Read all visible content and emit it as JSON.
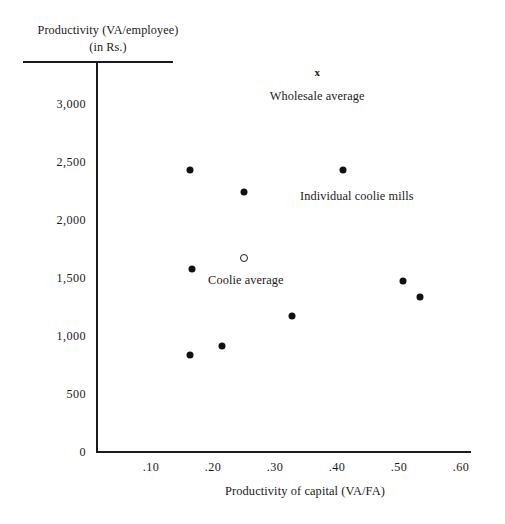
{
  "chart_data": {
    "type": "scatter",
    "title": "",
    "ylabel_line1": "Productivity (VA/employee)",
    "ylabel_line2": "(in Rs.)",
    "xlabel": "Productivity of capital (VA/FA)",
    "xlim": [
      0.0,
      0.65
    ],
    "ylim": [
      0,
      3400
    ],
    "grid": false,
    "legend": "none",
    "xticks": [
      ".10",
      ".20",
      ".30",
      ".40",
      ".50",
      ".60"
    ],
    "xtick_values": [
      0.1,
      0.2,
      0.3,
      0.4,
      0.5,
      0.6
    ],
    "yticks": [
      "0",
      "500",
      "1,000",
      "1,500",
      "2,000",
      "2,500",
      "3,000"
    ],
    "ytick_values": [
      0,
      500,
      1000,
      1500,
      2000,
      2500,
      3000
    ],
    "series": [
      {
        "name": "Individual coolie mills",
        "marker": "filled-circle",
        "points": [
          {
            "x": 0.163,
            "y": 2430
          },
          {
            "x": 0.25,
            "y": 2240
          },
          {
            "x": 0.41,
            "y": 2430
          },
          {
            "x": 0.166,
            "y": 1578
          },
          {
            "x": 0.327,
            "y": 1172
          },
          {
            "x": 0.506,
            "y": 1474
          },
          {
            "x": 0.534,
            "y": 1336
          },
          {
            "x": 0.215,
            "y": 914
          },
          {
            "x": 0.163,
            "y": 836
          }
        ]
      },
      {
        "name": "Coolie average",
        "marker": "open-circle",
        "points": [
          {
            "x": 0.25,
            "y": 1672
          }
        ]
      },
      {
        "name": "Wholesale average",
        "marker": "cross-x",
        "points": [
          {
            "x": 0.368,
            "y": 3276
          }
        ]
      }
    ],
    "annotations": [
      {
        "text": "Wholesale average",
        "x": 0.368,
        "y": 3130
      },
      {
        "text": "Individual coolie mills",
        "x": 0.432,
        "y": 2270
      },
      {
        "text": "Coolie average",
        "x": 0.253,
        "y": 1545
      }
    ]
  },
  "markers": {
    "cross_glyph": "x"
  }
}
